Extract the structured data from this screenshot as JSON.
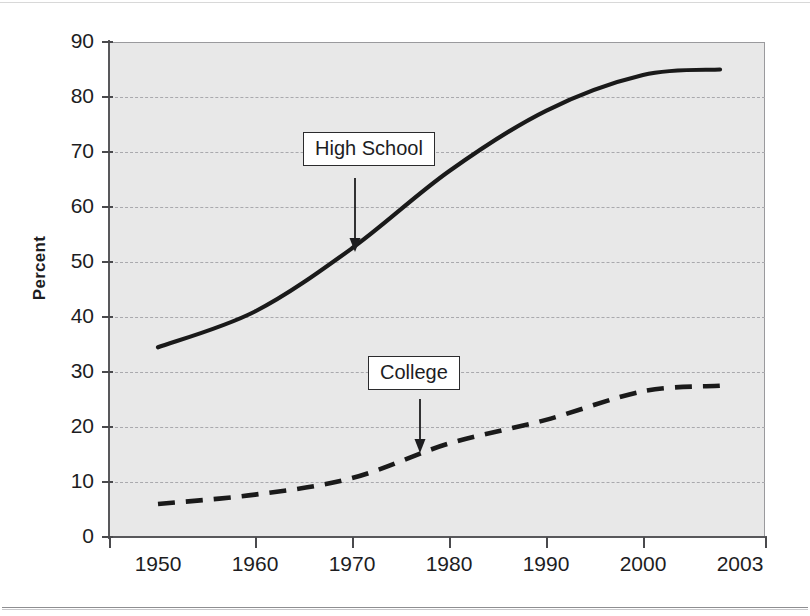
{
  "chart_data": {
    "type": "line",
    "title": "",
    "subtitle": "",
    "xlabel": "",
    "ylabel": "Percent",
    "x": [
      1950,
      1960,
      1970,
      1980,
      1990,
      2000,
      2003
    ],
    "categories": [
      "1950",
      "1960",
      "1970",
      "1980",
      "1990",
      "2000",
      "2003"
    ],
    "xtick_labels": [
      "1950",
      "1960",
      "1970",
      "1980",
      "1990",
      "2000",
      "2003"
    ],
    "ytick_labels": [
      "0",
      "10",
      "20",
      "30",
      "40",
      "50",
      "60",
      "70",
      "80",
      "90"
    ],
    "ylim": [
      0,
      90
    ],
    "ytick_step": 10,
    "grid": "horizontal-dashed",
    "legend_position": "inline-annotations",
    "plot_background": "#e8e8e8",
    "series": [
      {
        "name": "High School",
        "style": "solid",
        "color": "#1a1a1a",
        "values": [
          34.5,
          41.0,
          52.5,
          66.5,
          77.5,
          84.0,
          85.0
        ]
      },
      {
        "name": "College",
        "style": "dashed",
        "color": "#1a1a1a",
        "values": [
          6.0,
          7.7,
          10.7,
          17.0,
          21.3,
          26.5,
          27.5
        ]
      }
    ],
    "annotations": [
      {
        "label": "High School",
        "points_to_series": "High School",
        "points_to_x": 1970,
        "points_to_y": 54
      },
      {
        "label": "College",
        "points_to_series": "College",
        "points_to_x": 1977,
        "points_to_y": 15.5
      }
    ]
  },
  "axis": {
    "y_title": "Percent",
    "y_ticks": [
      "90",
      "80",
      "70",
      "60",
      "50",
      "40",
      "30",
      "20",
      "10",
      "0"
    ],
    "x_ticks": [
      "1950",
      "1960",
      "1970",
      "1980",
      "1990",
      "2000",
      "2003"
    ]
  },
  "annotations": {
    "high_school": "High School",
    "college": "College"
  }
}
